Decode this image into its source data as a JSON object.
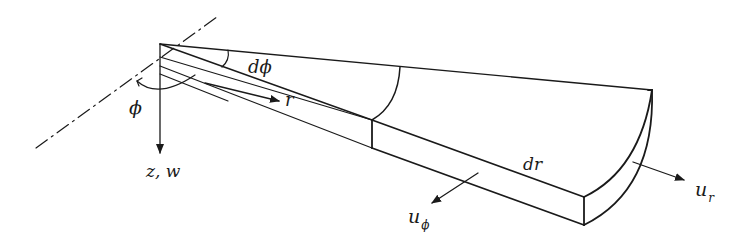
{
  "diagram": {
    "type": "wedge-element-polar-coordinates",
    "colors": {
      "stroke": "#1a1a1a",
      "background": "#ffffff"
    },
    "labels": {
      "phi": "ϕ",
      "dphi": "dϕ",
      "r": "r",
      "zw": "z, w",
      "dr": "dr",
      "u_phi_base": "u",
      "u_phi_sub": "ϕ",
      "u_r_base": "u",
      "u_r_sub": "r"
    },
    "elements": [
      "dash-dot reference axis",
      "vertical z-axis arrow",
      "angle arc phi",
      "angle arc dphi",
      "radial arrow r",
      "wedge element block",
      "displacement arrow u_phi",
      "displacement arrow u_r"
    ]
  }
}
